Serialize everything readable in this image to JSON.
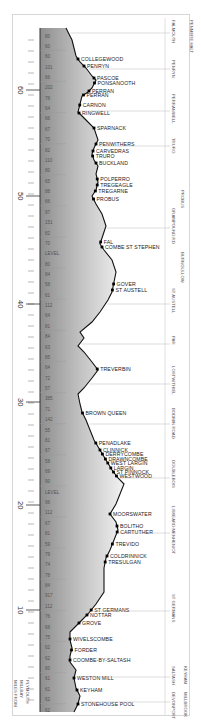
{
  "diagram": {
    "axis": {
      "label_lines": [
        "MILES FROM",
        "MILLBAY",
        "PLYMOUTH"
      ],
      "major_ticks": [
        {
          "label": "60",
          "y": 90
        },
        {
          "label": "50",
          "y": 196
        },
        {
          "label": "40",
          "y": 304
        },
        {
          "label": "30",
          "y": 402
        },
        {
          "label": "20",
          "y": 505
        },
        {
          "label": "10",
          "y": 610
        }
      ]
    },
    "gradients": [
      "80",
      "60",
      "60",
      "101",
      "66",
      "202",
      "78",
      "64",
      "66",
      "67",
      "70",
      "82",
      "110",
      "80",
      "65",
      "88",
      "66",
      "97",
      "151",
      "82",
      "70",
      "LEVEL",
      "80",
      "84",
      "58",
      "61",
      "112",
      "64",
      "81",
      "84",
      "63",
      "85",
      "64",
      "72",
      "57",
      "385",
      "71",
      "142",
      "55",
      "81",
      "67",
      "58",
      "69",
      "90",
      "LEVEL",
      "96",
      "112",
      "67",
      "81",
      "59",
      "79",
      "74",
      "78",
      "84",
      "917",
      "112",
      "76",
      "68",
      "75",
      "62",
      "62",
      "60",
      "61",
      "61",
      "62",
      "62"
    ],
    "stations": [
      {
        "name": "COLLEGEWOOD",
        "y": 59
      },
      {
        "name": "PENRYN",
        "y": 66
      },
      {
        "name": "PASCOE",
        "y": 78
      },
      {
        "name": "PONSANOOTH",
        "y": 83
      },
      {
        "name": "PERRAN",
        "y": 91
      },
      {
        "name": "PERRAN",
        "y": 95
      },
      {
        "name": "CARNON",
        "y": 105
      },
      {
        "name": "RINGWELL",
        "y": 113
      },
      {
        "name": "SPARNACK",
        "y": 128
      },
      {
        "name": "PENWITHERS",
        "y": 144
      },
      {
        "name": "CARVEDRAS",
        "y": 151
      },
      {
        "name": "TRURO",
        "y": 156
      },
      {
        "name": "BUCKLAND",
        "y": 163
      },
      {
        "name": "POLPERRO",
        "y": 179
      },
      {
        "name": "TREGEAGLE",
        "y": 185
      },
      {
        "name": "TREGARNE",
        "y": 191
      },
      {
        "name": "PROBUS",
        "y": 199
      },
      {
        "name": "FAL",
        "y": 242
      },
      {
        "name": "COMBE ST STEPHEN",
        "y": 247
      },
      {
        "name": "GOVER",
        "y": 284
      },
      {
        "name": "ST AUSTELL",
        "y": 290
      },
      {
        "name": "TREVERBIN",
        "y": 369
      },
      {
        "name": "BROWN QUEEN",
        "y": 413
      },
      {
        "name": "PENADLAKE",
        "y": 443
      },
      {
        "name": "CLINNICK",
        "y": 450
      },
      {
        "name": "DERRYCOMBE",
        "y": 454
      },
      {
        "name": "DRAWNCOMBE",
        "y": 459
      },
      {
        "name": "WEST LARGIN",
        "y": 463
      },
      {
        "name": "LARGIN",
        "y": 468
      },
      {
        "name": "ST PINNOCK",
        "y": 472
      },
      {
        "name": "WESTWOOD",
        "y": 476
      },
      {
        "name": "MOORSWATER",
        "y": 514
      },
      {
        "name": "BOLITHO",
        "y": 526
      },
      {
        "name": "CARTUTHER",
        "y": 532
      },
      {
        "name": "TREVIDO",
        "y": 544
      },
      {
        "name": "COLDRINNICK",
        "y": 556
      },
      {
        "name": "TRESULGAN",
        "y": 562
      },
      {
        "name": "ST GERMANS",
        "y": 610
      },
      {
        "name": "NOTTAR",
        "y": 615
      },
      {
        "name": "GROVE",
        "y": 623
      },
      {
        "name": "WIVELSCOMBE",
        "y": 639
      },
      {
        "name": "FORDER",
        "y": 650
      },
      {
        "name": "COOMBE-BY-SALTASH",
        "y": 660
      },
      {
        "name": "WESTON MILL",
        "y": 678
      },
      {
        "name": "KEYHAM",
        "y": 690
      },
      {
        "name": "STONEHOUSE POOL",
        "y": 704
      }
    ],
    "right_labels": [
      {
        "text": "PENMERE HALT",
        "x": 190,
        "y_top": 18,
        "y_bottom": 60
      },
      {
        "text": "FALMOUTH",
        "x": 172,
        "y_top": 18,
        "y_bottom": 48
      },
      {
        "text": "PENRYN",
        "x": 172,
        "y_top": 58,
        "y_bottom": 80
      },
      {
        "text": "PERRANWELL",
        "x": 172,
        "y_top": 92,
        "y_bottom": 130
      },
      {
        "text": "TRURO",
        "x": 172,
        "y_top": 136,
        "y_bottom": 156
      },
      {
        "text": "PROBUS",
        "x": 181,
        "y_top": 188,
        "y_bottom": 212
      },
      {
        "text": "GRAMPOUND RD",
        "x": 172,
        "y_top": 206,
        "y_bottom": 250
      },
      {
        "text": "BURNGULLOW",
        "x": 181,
        "y_top": 250,
        "y_bottom": 286
      },
      {
        "text": "ST AUSTELL",
        "x": 172,
        "y_top": 286,
        "y_bottom": 322
      },
      {
        "text": "PAR",
        "x": 172,
        "y_top": 334,
        "y_bottom": 354
      },
      {
        "text": "LOSTWITHIEL",
        "x": 172,
        "y_top": 364,
        "y_bottom": 404
      },
      {
        "text": "BODMIN ROAD",
        "x": 172,
        "y_top": 406,
        "y_bottom": 442
      },
      {
        "text": "DOUBLEBOIS",
        "x": 172,
        "y_top": 458,
        "y_bottom": 498
      },
      {
        "text": "LISKEARD MENHENIOT",
        "x": 172,
        "y_top": 504,
        "y_bottom": 562
      },
      {
        "text": "ST GERMANS",
        "x": 172,
        "y_top": 592,
        "y_bottom": 630
      },
      {
        "text": "SALTASH",
        "x": 172,
        "y_top": 664,
        "y_bottom": 690
      },
      {
        "text": "KEYHAM",
        "x": 184,
        "y_top": 664,
        "y_bottom": 690
      },
      {
        "text": "DEVONPORT",
        "x": 172,
        "y_top": 690,
        "y_bottom": 714
      },
      {
        "text": "MILLBROOK",
        "x": 184,
        "y_top": 690,
        "y_bottom": 716
      }
    ]
  }
}
